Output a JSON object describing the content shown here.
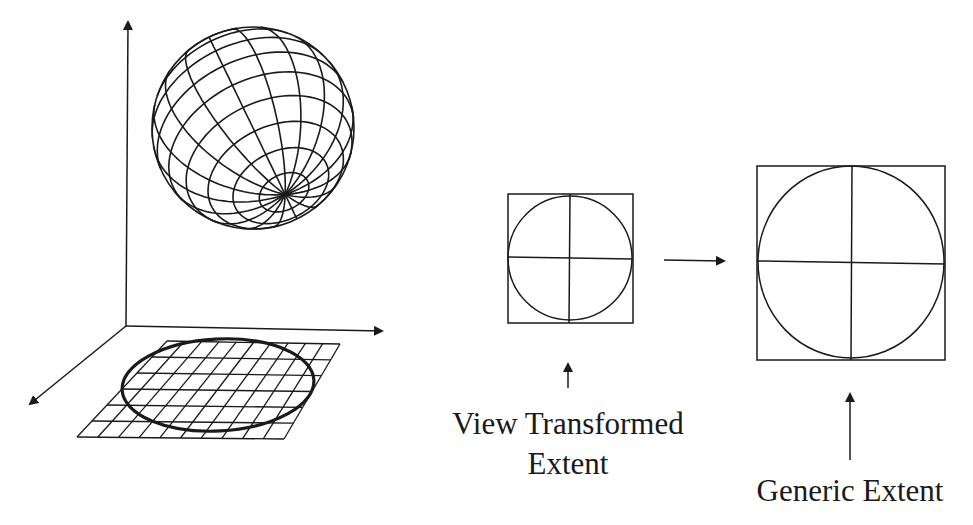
{
  "figure": {
    "stroke_color": "#1a1a1a",
    "background": "#ffffff"
  },
  "labels": {
    "view_transformed_line1": "View Transformed",
    "view_transformed_line2": "Extent",
    "generic_extent": "Generic Extent"
  },
  "elements": {
    "axes": [
      "vertical-axis",
      "horizontal-axis",
      "depth-axis"
    ],
    "sphere": {
      "meridians": 18,
      "parallels": 12
    },
    "ground_grid": {
      "rows": 6,
      "cols": 10,
      "projected_ellipse": true
    },
    "small_box": {
      "name": "view-transformed-extent",
      "quadrant_cross": true,
      "inscribed_circle": true
    },
    "large_box": {
      "name": "generic-extent",
      "quadrant_cross": true,
      "inscribed_circle": true
    },
    "transform_arrow": "right"
  }
}
